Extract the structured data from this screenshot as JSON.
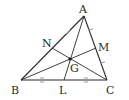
{
  "diagram": {
    "type": "triangle-medians-centroid",
    "colors": {
      "line": "#2a2a2a",
      "tick": "#9a9a9a",
      "background": "#ffffff"
    },
    "points": {
      "A": {
        "label": "A",
        "x": 84,
        "y": 16
      },
      "B": {
        "label": "B",
        "x": 21,
        "y": 80
      },
      "C": {
        "label": "C",
        "x": 107,
        "y": 80
      },
      "L": {
        "label": "L",
        "x": 64,
        "y": 80
      },
      "M": {
        "label": "M",
        "x": 96,
        "y": 48
      },
      "N": {
        "label": "N",
        "x": 52,
        "y": 48
      },
      "G": {
        "label": "G",
        "x": 70,
        "y": 59
      }
    },
    "edges": [
      "AB",
      "BC",
      "CA"
    ],
    "medians": [
      "AL",
      "BM",
      "CN"
    ],
    "tick_marks": {
      "AB": "single",
      "BC": "double",
      "AC": "slash"
    }
  }
}
